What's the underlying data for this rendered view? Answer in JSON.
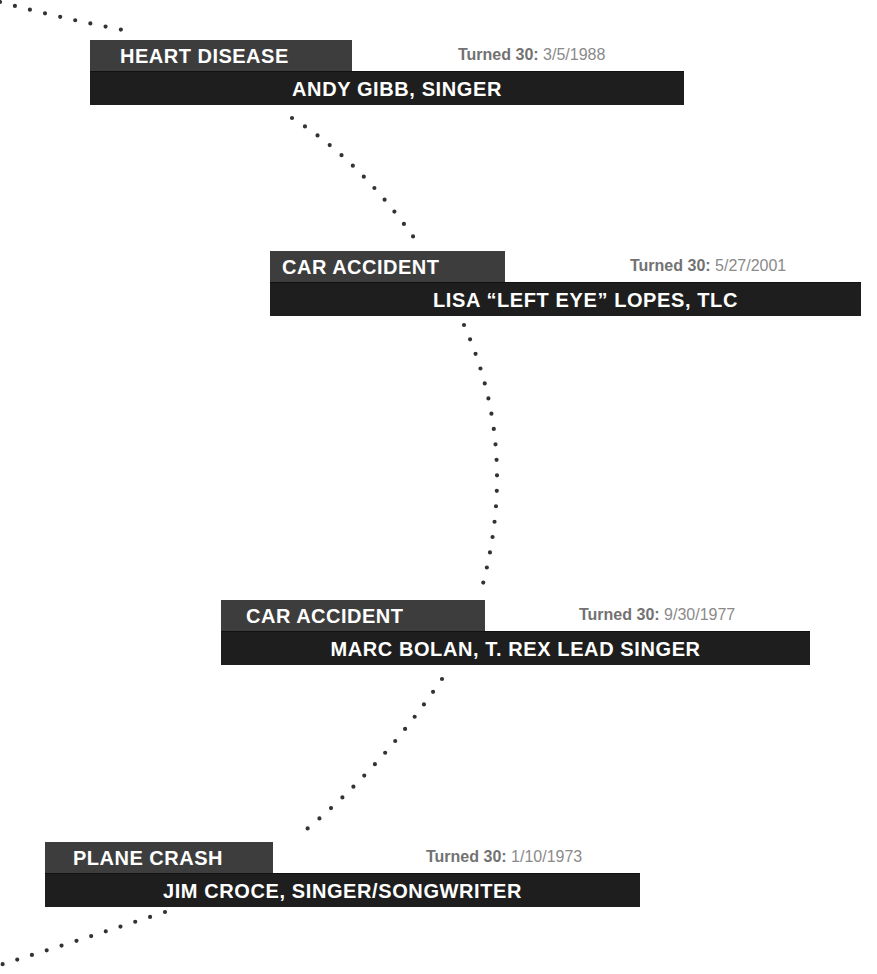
{
  "entries": [
    {
      "cause": "HEART DISEASE",
      "name": "ANDY GIBB, SINGER",
      "turned_label": "Turned 30:",
      "turned_date": "3/5/1988"
    },
    {
      "cause": "CAR ACCIDENT",
      "name": "LISA “LEFT EYE” LOPES, TLC",
      "turned_label": "Turned 30:",
      "turned_date": "5/27/2001"
    },
    {
      "cause": "CAR ACCIDENT",
      "name": "MARC BOLAN, T. REX LEAD SINGER",
      "turned_label": "Turned 30:",
      "turned_date": "9/30/1977"
    },
    {
      "cause": "PLANE CRASH",
      "name": "JIM CROCE, SINGER/SONGWRITER",
      "turned_label": "Turned 30:",
      "turned_date": "1/10/1973"
    }
  ],
  "colors": {
    "cause_tab": "#3d3d3d",
    "name_bar": "#1e1e1e",
    "dots": "#333333",
    "turned_text": "#777777"
  }
}
